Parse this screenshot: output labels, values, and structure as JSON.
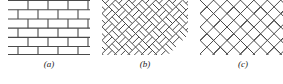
{
  "figure": {
    "name": "masonry-bond-patterns",
    "background_color": "#ffffff",
    "line_color": "#4a4a4a",
    "line_color_dark": "#3a3a3a",
    "width": 283,
    "height": 84
  },
  "panels": [
    {
      "id": "a",
      "caption": "(a)",
      "pattern": "running-bond",
      "description": "Horizontal running bond brick wall with staggered vertical joints",
      "art": {
        "width": 82,
        "height": 55,
        "courses": 6,
        "course_height": 9.2,
        "brick_length": 20,
        "stagger_offset": 10,
        "stroke": "#4a4a4a",
        "stroke_width": 1.1
      }
    },
    {
      "id": "b",
      "caption": "(b)",
      "pattern": "diagonal-basketweave",
      "description": "Diagonal basketweave / double herringbone lattice at 45 degrees",
      "art": {
        "width": 86,
        "height": 55,
        "spacing": 9.5,
        "angle_deg": 45,
        "stroke": "#4a4a4a",
        "stroke_width": 1.0
      }
    },
    {
      "id": "c",
      "caption": "(c)",
      "pattern": "herringbone",
      "description": "Herringbone bond with perpendicular bricks laid at 45 degrees",
      "art": {
        "width": 86,
        "height": 55,
        "spacing": 9.5,
        "angle_deg": 45,
        "stroke": "#4a4a4a",
        "stroke_width": 1.0
      }
    }
  ]
}
